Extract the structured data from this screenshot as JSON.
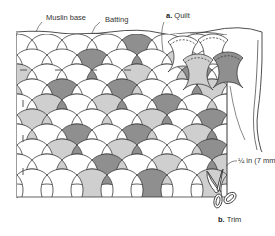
{
  "diagram": {
    "labels": {
      "muslin_base": "Muslin base",
      "batting": "Batting",
      "quilt_letter": "a.",
      "quilt_text": "Quilt",
      "measurement": "¼ in (7 mm)",
      "trim_letter": "b.",
      "trim_text": "Trim"
    },
    "colors": {
      "line": "#3a3a3a",
      "dark_fill": "#8f8f8f",
      "light_fill": "#cfcfcf",
      "background": "#ffffff"
    },
    "icons": [
      "scissors-icon"
    ]
  }
}
